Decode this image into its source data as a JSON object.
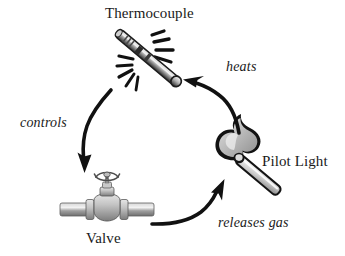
{
  "diagram": {
    "background_color": "#ffffff",
    "ink_color": "#1a1a1a",
    "metal_color": "#9a9a9a",
    "flame_color": "#bdbdbd",
    "nodes": [
      {
        "id": "thermocouple",
        "label": "Thermocouple",
        "icon": "thermocouple-probe-icon",
        "label_position": "above"
      },
      {
        "id": "pilot-light",
        "label": "Pilot Light",
        "icon": "lit-match-flame-icon",
        "label_position": "right"
      },
      {
        "id": "valve",
        "label": "Valve",
        "icon": "gate-valve-icon",
        "label_position": "below"
      }
    ],
    "edges": [
      {
        "id": "controls",
        "label": "controls",
        "from": "thermocouple",
        "to": "valve",
        "style": "curved-arrow",
        "icon": "curved-arrow-down-icon"
      },
      {
        "id": "releases-gas",
        "label": "releases gas",
        "from": "valve",
        "to": "pilot-light",
        "style": "curved-arrow",
        "icon": "curved-arrow-up-right-icon"
      },
      {
        "id": "heats",
        "label": "heats",
        "from": "pilot-light",
        "to": "thermocouple",
        "style": "curved-arrow",
        "icon": "curved-arrow-up-left-icon"
      }
    ]
  }
}
